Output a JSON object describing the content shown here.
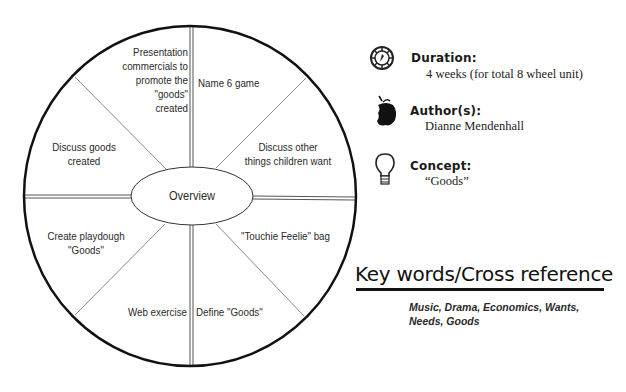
{
  "wheel": {
    "center": "Overview",
    "segments": [
      {
        "position": "top-left",
        "label_lines": [
          "Presentation",
          "commercials to",
          "promote the",
          "\"goods\"",
          "created"
        ]
      },
      {
        "position": "top-right",
        "label": "Name 6 game"
      },
      {
        "position": "right-upper",
        "label_lines": [
          "Discuss other",
          "things children want"
        ]
      },
      {
        "position": "right-lower",
        "label": "\"Touchie Feelie\" bag"
      },
      {
        "position": "bottom-right",
        "label": "Define \"Goods\""
      },
      {
        "position": "bottom-left",
        "label": "Web exercise"
      },
      {
        "position": "left-lower",
        "label_lines": [
          "Create playdough",
          "\"Goods\""
        ]
      },
      {
        "position": "left-upper",
        "label_lines": [
          "Discuss goods",
          "created"
        ]
      }
    ]
  },
  "info": {
    "duration": {
      "icon": "wheel-compass-icon",
      "title": "Duration:",
      "value": "4 weeks (for total 8 wheel unit)"
    },
    "authors": {
      "icon": "apple-icon",
      "title": "Author(s):",
      "value": "Dianne Mendenhall"
    },
    "concept": {
      "icon": "lightbulb-icon",
      "title": "Concept:",
      "value": "“Goods”"
    }
  },
  "keywords": {
    "heading": "Key words/Cross reference",
    "text": "Music, Drama, Economics, Wants, Needs, Goods"
  },
  "colors": {
    "ink": "#111111",
    "divider": "#888888",
    "text": "#2a2a2a"
  }
}
